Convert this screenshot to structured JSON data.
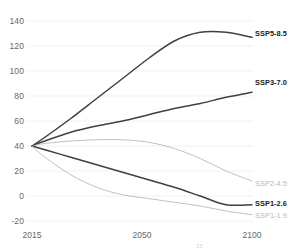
{
  "chart_data": {
    "type": "line",
    "title": "",
    "subtitle": "",
    "xlabel": "",
    "ylabel": "",
    "xlim": [
      2015,
      2100
    ],
    "ylim": [
      -20,
      140
    ],
    "grid": true,
    "grid_axis": "y",
    "legend_position": "right-inline-labels",
    "x_ticks": [
      "2015",
      "2050",
      "2100"
    ],
    "x_tick_values": [
      2015,
      2050,
      2100
    ],
    "y_ticks": [
      "140",
      "120",
      "100",
      "80",
      "60",
      "40",
      "20",
      "0",
      "-20"
    ],
    "y_tick_values": [
      140,
      120,
      100,
      80,
      60,
      40,
      20,
      0,
      -20
    ],
    "x": [
      2015,
      2020,
      2030,
      2040,
      2050,
      2060,
      2070,
      2080,
      2090,
      2100
    ],
    "series": [
      {
        "name": "SSP5-8.5",
        "label": "SSP5-8.5",
        "color": "#404040",
        "emphasis": "dark",
        "values": [
          40,
          47,
          62,
          78,
          94,
          110,
          124,
          131,
          131,
          127
        ]
      },
      {
        "name": "SSP3-7.0",
        "label": "SSP3-7.0",
        "color": "#404040",
        "emphasis": "dark",
        "values": [
          40,
          44,
          51,
          56,
          60,
          65,
          70,
          74,
          79,
          83
        ]
      },
      {
        "name": "SSP2-4.5",
        "label": "SSP2-4.5",
        "color": "#b9b9b9",
        "emphasis": "light",
        "values": [
          40,
          42,
          44,
          45,
          45,
          43,
          38,
          30,
          20,
          12
        ]
      },
      {
        "name": "SSP1-2.6",
        "label": "SSP1-2.6",
        "color": "#404040",
        "emphasis": "dark",
        "values": [
          40,
          37,
          31,
          25,
          19,
          13,
          7,
          0,
          -7,
          -7
        ]
      },
      {
        "name": "SSP1-1.9",
        "label": "SSP1-1.9",
        "color": "#b9b9b9",
        "emphasis": "light",
        "values": [
          40,
          31,
          17,
          7,
          1,
          -2,
          -5,
          -8,
          -12,
          -15
        ]
      }
    ],
    "annotations": []
  },
  "footer": {
    "mark": "15"
  }
}
